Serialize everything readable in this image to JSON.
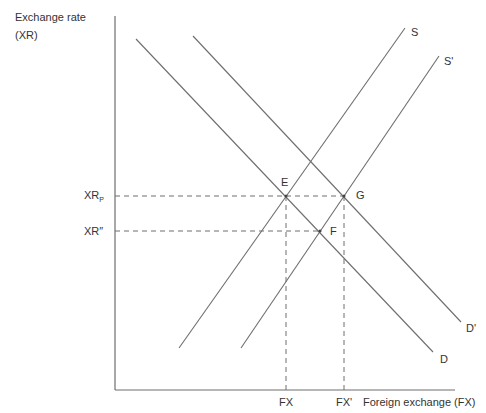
{
  "diagram": {
    "y_axis_label_line1": "Exchange rate",
    "y_axis_label_line2": "(XR)",
    "x_axis_label": "Foreign exchange (FX)",
    "y_ticks": {
      "xr_p_base": "XR",
      "xr_p_sub": "P",
      "xr_double_prime": "XR″"
    },
    "x_ticks": {
      "fx": "FX",
      "fx_prime": "FX'"
    },
    "curves": {
      "s": "S",
      "s_prime": "S'",
      "d": "D",
      "d_prime": "D'"
    },
    "points": {
      "e": "E",
      "f": "F",
      "g": "G"
    },
    "colors": {
      "line": "#6e6e6e",
      "axis": "#6e6e6e",
      "text": "#333333"
    }
  }
}
